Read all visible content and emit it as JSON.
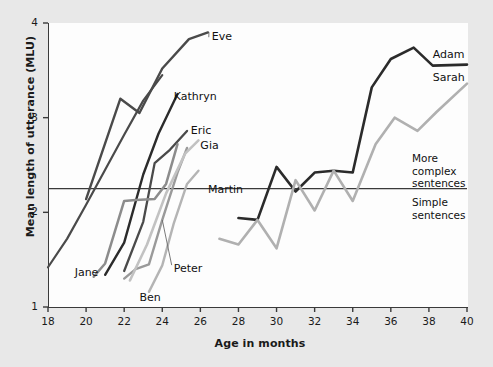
{
  "chart_data": {
    "type": "line",
    "title": "",
    "xlabel": "Age in months",
    "ylabel": "Mean length of utterance (MLU)",
    "xlim": [
      18,
      40
    ],
    "ylim": [
      1,
      4
    ],
    "xticks": [
      18,
      20,
      22,
      24,
      26,
      28,
      30,
      32,
      34,
      36,
      38,
      40
    ],
    "yticks": [
      1,
      2,
      3,
      4
    ],
    "grid": false,
    "legend": "inline-labels",
    "annotations": [
      {
        "name": "threshold-line",
        "type": "hline",
        "y": 2.25,
        "label_above": "More complex sentences",
        "label_below": "Simple sentences"
      },
      {
        "name": "zone-above",
        "text": "More complex sentences"
      },
      {
        "name": "zone-below",
        "text": "Simple sentences"
      }
    ],
    "series": [
      {
        "name": "Jane",
        "color": "#4a4a4a",
        "width": 2.2,
        "label_x": 19.4,
        "label_y": 1.36,
        "x": [
          18.0,
          19.0,
          20.0,
          21.0,
          22.0,
          23.0,
          24.0
        ],
        "y": [
          1.42,
          1.72,
          2.08,
          2.45,
          2.82,
          3.18,
          3.45
        ]
      },
      {
        "name": "Eve",
        "color": "#4a4a4a",
        "width": 2.4,
        "label_x": 26.6,
        "label_y": 3.85,
        "x": [
          20.0,
          21.8,
          22.8,
          24.0,
          25.4,
          26.4
        ],
        "y": [
          2.14,
          3.2,
          3.05,
          3.52,
          3.83,
          3.9
        ]
      },
      {
        "name": "Kathryn",
        "color": "#2b2b2b",
        "width": 2.4,
        "label_x": 24.6,
        "label_y": 3.22,
        "x": [
          21.0,
          22.0,
          23.0,
          23.8,
          24.8
        ],
        "y": [
          1.34,
          1.68,
          2.4,
          2.83,
          3.25
        ]
      },
      {
        "name": "Ben",
        "color": "#9a9a9a",
        "width": 2.4,
        "label_x": 22.8,
        "label_y": 1.1,
        "x": [
          22.0,
          22.6,
          23.3,
          24.0,
          24.8,
          25.3
        ],
        "y": [
          1.3,
          1.4,
          1.45,
          1.92,
          2.42,
          2.68
        ]
      },
      {
        "name": "Eric",
        "color": "#4a4a4a",
        "width": 2.3,
        "label_x": 25.5,
        "label_y": 2.86,
        "x": [
          22.0,
          23.0,
          23.6,
          24.4,
          25.3
        ],
        "y": [
          1.38,
          1.9,
          2.52,
          2.66,
          2.86
        ]
      },
      {
        "name": "Gia",
        "color": "#c2c2c2",
        "width": 2.6,
        "label_x": 26.0,
        "label_y": 2.7,
        "x": [
          22.3,
          23.2,
          24.2,
          25.2,
          25.9
        ],
        "y": [
          1.28,
          1.66,
          2.2,
          2.62,
          2.76
        ]
      },
      {
        "name": "Peter",
        "color": "#b4b4b4",
        "width": 2.4,
        "label_x": 24.6,
        "label_y": 1.4,
        "x": [
          23.3,
          24.0,
          24.6,
          25.3,
          25.9
        ],
        "y": [
          1.16,
          1.44,
          1.88,
          2.3,
          2.44
        ]
      },
      {
        "name": "Martin",
        "color": "#8c8c8c",
        "width": 2.5,
        "label_x": 26.4,
        "label_y": 2.24,
        "x": [
          20.4,
          21.0,
          22.0,
          22.6,
          23.6,
          24.2,
          24.8
        ],
        "y": [
          1.32,
          1.46,
          2.12,
          2.13,
          2.14,
          2.3,
          2.72
        ]
      },
      {
        "name": "Adam",
        "color": "#2b2b2b",
        "width": 2.6,
        "label_x": 38.2,
        "label_y": 3.66,
        "x": [
          28.0,
          29.0,
          30.0,
          31.0,
          32.0,
          33.0,
          34.0,
          35.0,
          36.0,
          37.2,
          38.2,
          40.0
        ],
        "y": [
          1.94,
          1.92,
          2.48,
          2.22,
          2.42,
          2.44,
          2.42,
          3.32,
          3.62,
          3.74,
          3.55,
          3.56
        ]
      },
      {
        "name": "Sarah",
        "color": "#b0b0b0",
        "width": 2.6,
        "label_x": 38.2,
        "label_y": 3.42,
        "x": [
          27.0,
          28.0,
          29.0,
          30.0,
          31.0,
          32.0,
          33.0,
          34.0,
          35.2,
          36.2,
          37.4,
          38.4,
          40.0
        ],
        "y": [
          1.72,
          1.66,
          1.92,
          1.62,
          2.34,
          2.02,
          2.44,
          2.12,
          2.72,
          3.0,
          2.86,
          3.06,
          3.36
        ]
      }
    ]
  },
  "axes": {
    "x_title": "Age in months",
    "y_title": "Mean length of utterance (MLU)",
    "x_tick_labels": [
      "18",
      "20",
      "22",
      "24",
      "26",
      "28",
      "30",
      "32",
      "34",
      "36",
      "38",
      "40"
    ],
    "y_tick_labels": [
      "1",
      "2",
      "3",
      "4"
    ]
  },
  "series_labels": {
    "jane": "Jane",
    "eve": "Eve",
    "kathryn": "Kathryn",
    "ben": "Ben",
    "eric": "Eric",
    "gia": "Gia",
    "peter": "Peter",
    "martin": "Martin",
    "adam": "Adam",
    "sarah": "Sarah"
  },
  "zone_labels": {
    "more_complex_line1": "More",
    "more_complex_line2": "complex",
    "more_complex_line3": "sentences",
    "simple_line1": "Simple",
    "simple_line2": "sentences"
  },
  "colors": {
    "background": "#e8e8e8",
    "plot_background": "#fdfdfd",
    "axis": "#3a3a3a",
    "text": "#1a1a1a"
  }
}
